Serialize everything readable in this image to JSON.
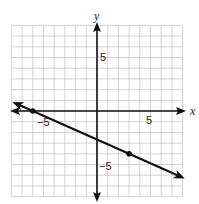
{
  "chart_data": {
    "type": "line",
    "title": "",
    "xlabel": "x",
    "ylabel": "y",
    "xlim": [
      -8,
      8
    ],
    "ylim": [
      -8,
      8
    ],
    "grid": true,
    "tick_labels": {
      "x": [
        {
          "value": -5,
          "label": "−5"
        },
        {
          "value": 5,
          "label": "5"
        }
      ],
      "y": [
        {
          "value": 5,
          "label": "5"
        },
        {
          "value": -5,
          "label": "−5"
        }
      ]
    },
    "series": [
      {
        "name": "line",
        "equation": "y = -4/9 x - 8/3",
        "slope": -0.4444,
        "intercept": -2.667,
        "points": [
          {
            "x": -6,
            "y": 0
          },
          {
            "x": 3,
            "y": -4
          }
        ]
      }
    ],
    "colors": {
      "grid": "#c8c8c8",
      "axis": "#111111",
      "line": "#111111"
    }
  },
  "labels": {
    "x_axis": "x",
    "y_axis": "y",
    "x_neg5": "−5",
    "x_pos5": "5",
    "y_pos5": "5",
    "y_neg5": "−5"
  }
}
